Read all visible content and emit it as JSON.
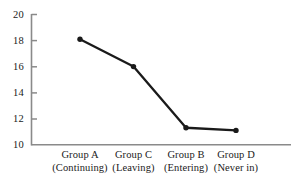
{
  "chart_data": {
    "type": "line",
    "title": "",
    "subtitle": "",
    "xlabel": "",
    "ylabel": "",
    "categories": [
      "Group A",
      "Group C",
      "Group B",
      "Group D"
    ],
    "category_subtitles": [
      "(Continuing)",
      "(Leaving)",
      "(Entering)",
      "(Never in)"
    ],
    "values": [
      18.1,
      16.0,
      11.3,
      11.1
    ],
    "series": [
      {
        "name": "",
        "values": [
          18.1,
          16.0,
          11.3,
          11.1
        ]
      }
    ],
    "ylim": [
      10,
      20
    ],
    "yticks": [
      20,
      18,
      16,
      14,
      12,
      10
    ],
    "ytick_labels": [
      "20",
      "18",
      "16",
      "14",
      "12",
      "10"
    ],
    "grid": false,
    "legend": false,
    "legend_position": "none",
    "marker": "filled-circle",
    "line_color": "#1a1a1a",
    "marker_color": "#1a1a1a",
    "axis_color": "#8a8a8a",
    "tick_direction": "in"
  },
  "axis": {
    "y_labels": [
      {
        "text": "20",
        "value": 20
      },
      {
        "text": "18",
        "value": 18
      },
      {
        "text": "16",
        "value": 16
      },
      {
        "text": "14",
        "value": 14
      },
      {
        "text": "12",
        "value": 12
      },
      {
        "text": "10",
        "value": 10
      }
    ],
    "x_labels": [
      {
        "name": "Group A",
        "sub": "(Continuing)"
      },
      {
        "name": "Group C",
        "sub": "(Leaving)"
      },
      {
        "name": "Group B",
        "sub": "(Entering)"
      },
      {
        "name": "Group D",
        "sub": "(Never in)"
      }
    ]
  }
}
